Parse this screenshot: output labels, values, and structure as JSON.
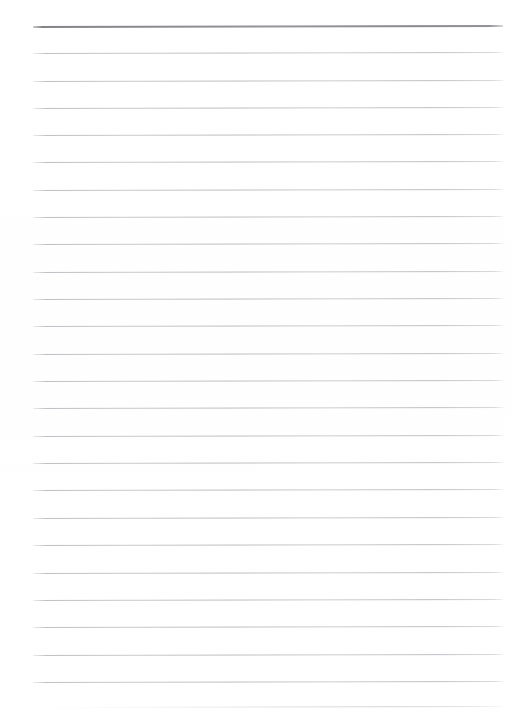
{
  "document": {
    "kind": "scanned-ruled-notebook-page",
    "page_label": "",
    "body_text": "",
    "background_color": "#ffffff"
  },
  "ruling": {
    "line_color": "#c2c2c6",
    "header_line_color": "#8c8c90",
    "faint_line_color": "#dcdce0",
    "left_x": 33,
    "right_x": 503,
    "first_line_y": 26,
    "line_spacing": 27.3,
    "skew_degrees": -0.12,
    "lines": [
      {
        "y": 26,
        "style": "header",
        "thickness": 2.0
      },
      {
        "y": 53,
        "style": "body",
        "thickness": 1.0
      },
      {
        "y": 81,
        "style": "body",
        "thickness": 1.0
      },
      {
        "y": 108,
        "style": "body",
        "thickness": 1.0
      },
      {
        "y": 135,
        "style": "body",
        "thickness": 1.0
      },
      {
        "y": 162,
        "style": "body",
        "thickness": 1.0
      },
      {
        "y": 190,
        "style": "body",
        "thickness": 1.0
      },
      {
        "y": 217,
        "style": "body",
        "thickness": 1.0
      },
      {
        "y": 244,
        "style": "body",
        "thickness": 1.0
      },
      {
        "y": 272,
        "style": "body",
        "thickness": 1.0
      },
      {
        "y": 299,
        "style": "body",
        "thickness": 1.0
      },
      {
        "y": 326,
        "style": "body",
        "thickness": 1.0
      },
      {
        "y": 354,
        "style": "body",
        "thickness": 1.0
      },
      {
        "y": 381,
        "style": "body",
        "thickness": 1.0
      },
      {
        "y": 408,
        "style": "body",
        "thickness": 1.0
      },
      {
        "y": 436,
        "style": "body",
        "thickness": 1.0
      },
      {
        "y": 463,
        "style": "body",
        "thickness": 1.0
      },
      {
        "y": 490,
        "style": "body",
        "thickness": 1.0
      },
      {
        "y": 518,
        "style": "body",
        "thickness": 1.0
      },
      {
        "y": 545,
        "style": "body",
        "thickness": 1.0
      },
      {
        "y": 573,
        "style": "body",
        "thickness": 1.0
      },
      {
        "y": 600,
        "style": "body",
        "thickness": 1.0
      },
      {
        "y": 627,
        "style": "body",
        "thickness": 1.0
      },
      {
        "y": 655,
        "style": "body",
        "thickness": 1.0
      },
      {
        "y": 682,
        "style": "body",
        "thickness": 1.0
      },
      {
        "y": 707,
        "style": "faint",
        "thickness": 1.0
      }
    ]
  }
}
